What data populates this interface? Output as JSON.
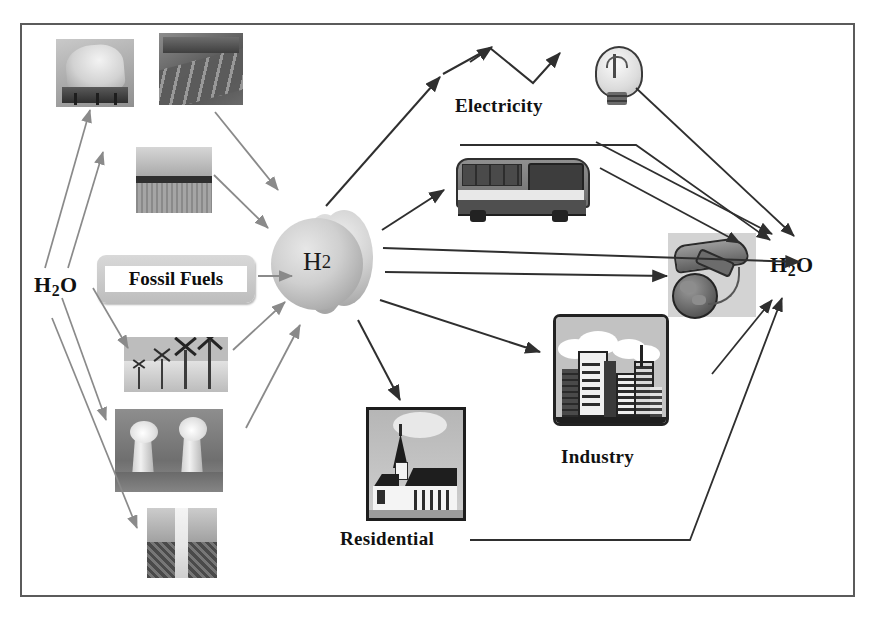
{
  "diagram": {
    "frame": {
      "border_color": "#5b5b5b"
    },
    "labels": {
      "water_input": "H₂O",
      "water_output": "H₂O",
      "hydrogen": "H₂",
      "fossil_fuels": "Fossil Fuels",
      "electricity": "Electricity",
      "industry": "Industry",
      "residential": "Residential"
    },
    "water_input_parts": {
      "h": "H",
      "two": "2",
      "o": "O"
    },
    "water_output_parts": {
      "h": "H",
      "two": "2",
      "o": "O"
    },
    "hydrogen_parts": {
      "h": "H",
      "two": "2"
    },
    "sources": [
      {
        "id": "solar-thermal",
        "name": "solar-thermal-collector-photo",
        "caption": ""
      },
      {
        "id": "solar-pv",
        "name": "solar-photovoltaic-array-photo",
        "caption": ""
      },
      {
        "id": "biomass",
        "name": "biomass-field-photo",
        "caption": ""
      },
      {
        "id": "fossil-fuels",
        "name": "fossil-fuels-box",
        "caption": "Fossil Fuels"
      },
      {
        "id": "wind",
        "name": "wind-turbines-photo",
        "caption": ""
      },
      {
        "id": "nuclear",
        "name": "nuclear-cooling-towers-photo",
        "caption": ""
      },
      {
        "id": "geothermal",
        "name": "geothermal-steam-vent-photo",
        "caption": ""
      }
    ],
    "uses": [
      {
        "id": "electricity",
        "name": "electricity-icon",
        "caption": "Electricity"
      },
      {
        "id": "transport",
        "name": "bus-photo",
        "caption": ""
      },
      {
        "id": "aviation",
        "name": "airplane-globe-icon",
        "caption": ""
      },
      {
        "id": "industry",
        "name": "industry-icon",
        "caption": "Industry"
      },
      {
        "id": "residential",
        "name": "residential-church-photo",
        "caption": "Residential"
      },
      {
        "id": "lightbulb",
        "name": "light-bulb-icon",
        "caption": ""
      }
    ],
    "colors": {
      "arrow_dark": "#3a3a3a",
      "arrow_mid": "#7a7a7a",
      "frame": "#5b5b5b",
      "text": "#111111",
      "cylinder": "#c8c8c8"
    }
  }
}
